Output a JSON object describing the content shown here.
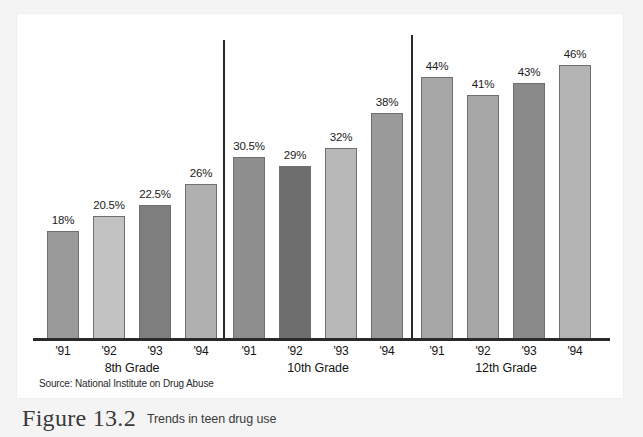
{
  "figure": {
    "number": "Figure 13.2",
    "caption": "Trends in teen drug use",
    "source": "Source: National Institute on Drug Abuse"
  },
  "chart_data": {
    "type": "bar",
    "title": "Trends in teen drug use",
    "subtitle": "",
    "xlabel": "",
    "ylabel": "",
    "ylim": [
      0,
      50
    ],
    "grid": false,
    "legend": "none",
    "value_labels": true,
    "categories": [
      "'91",
      "'92",
      "'93",
      "'94"
    ],
    "groups": [
      {
        "name": "8th Grade",
        "bars": [
          {
            "category": "'91",
            "value": 18,
            "label": "18%",
            "color": "#9a9a9a"
          },
          {
            "category": "'92",
            "value": 20.5,
            "label": "20.5%",
            "color": "#c2c2c2"
          },
          {
            "category": "'93",
            "value": 22.5,
            "label": "22.5%",
            "color": "#7e7e7e"
          },
          {
            "category": "'94",
            "value": 26,
            "label": "26%",
            "color": "#b0b0b0"
          }
        ]
      },
      {
        "name": "10th Grade",
        "bars": [
          {
            "category": "'91",
            "value": 30.5,
            "label": "30.5%",
            "color": "#8e8e8e"
          },
          {
            "category": "'92",
            "value": 29,
            "label": "29%",
            "color": "#6e6e6e"
          },
          {
            "category": "'93",
            "value": 32,
            "label": "32%",
            "color": "#b8b8b8"
          },
          {
            "category": "'94",
            "value": 38,
            "label": "38%",
            "color": "#9a9a9a"
          }
        ]
      },
      {
        "name": "12th Grade",
        "bars": [
          {
            "category": "'91",
            "value": 44,
            "label": "44%",
            "color": "#a6a6a6"
          },
          {
            "category": "'92",
            "value": 41,
            "label": "41%",
            "color": "#a6a6a6"
          },
          {
            "category": "'93",
            "value": 43,
            "label": "43%",
            "color": "#8a8a8a"
          },
          {
            "category": "'94",
            "value": 46,
            "label": "46%",
            "color": "#b4b4b4"
          }
        ]
      }
    ]
  },
  "layout": {
    "baseline_y": 324,
    "px_per_percent": 5.93,
    "bar_width": 32,
    "group_starts": [
      30,
      216,
      404
    ],
    "bar_pitch": 46,
    "divider_x": [
      216,
      404
    ],
    "divider_top": [
      26,
      21
    ]
  }
}
